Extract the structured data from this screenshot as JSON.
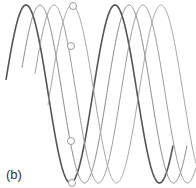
{
  "figure": {
    "panel_label": "(b)",
    "background": "#ffffff",
    "wave": {
      "center_y": 94,
      "amplitude": 89,
      "period": 89
    },
    "curves": [
      {
        "name": "wave-1",
        "color": "#555555",
        "width": 1.6,
        "x_start": 6,
        "x_end": 173,
        "peak_x": 26
      },
      {
        "name": "wave-2",
        "color": "#8a8a8a",
        "width": 1.0,
        "x_start": 22,
        "x_end": 187,
        "peak_x": 40
      },
      {
        "name": "wave-3",
        "color": "#9a9a9a",
        "width": 1.0,
        "x_start": 35,
        "x_end": 196,
        "peak_x": 54
      },
      {
        "name": "wave-4",
        "color": "#a5a5a5",
        "width": 1.0,
        "x_start": 48,
        "x_end": 196,
        "peak_x": 72
      }
    ],
    "markers": [
      {
        "cx": 73,
        "cy": 6,
        "r": 3.5
      },
      {
        "cx": 71,
        "cy": 46,
        "r": 3.5
      },
      {
        "cx": 71,
        "cy": 141,
        "r": 3.5
      },
      {
        "cx": 72,
        "cy": 183,
        "r": 3.5
      }
    ],
    "marker_stroke": "#999999"
  }
}
